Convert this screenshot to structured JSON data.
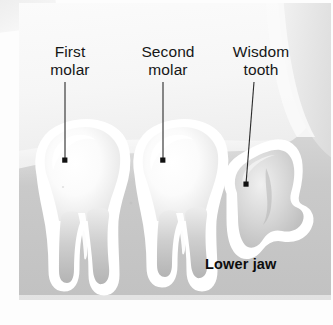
{
  "figure": {
    "type": "anatomical-illustration",
    "background_color": "#eeeeee",
    "label_color": "#161616",
    "leader_line_color": "#2a2a2a",
    "bone_color": "#c9c9c9",
    "tooth_color": "#f4f4f4",
    "halo_color": "#ffffff"
  },
  "labels": {
    "first_molar": "First\nmolar",
    "second_molar": "Second\nmolar",
    "wisdom_tooth": "Wisdom\ntooth",
    "lower_jaw": "Lower jaw"
  },
  "leaders": [
    {
      "name": "first-molar-leader",
      "x1": 65,
      "y1": 82,
      "x2": 65,
      "y2": 160
    },
    {
      "name": "second-molar-leader",
      "x1": 163,
      "y1": 82,
      "x2": 163,
      "y2": 160
    },
    {
      "name": "wisdom-tooth-leader",
      "x1": 254,
      "y1": 82,
      "x2": 246,
      "y2": 184
    }
  ],
  "structures": [
    {
      "name": "first-molar",
      "description": "Fully erupted first molar with crown and two roots"
    },
    {
      "name": "second-molar",
      "description": "Fully erupted second molar with crown and two roots"
    },
    {
      "name": "wisdom-tooth",
      "description": "Impacted third molar tilted forward inside the bone"
    },
    {
      "name": "mandible",
      "description": "Lower jaw bone surrounding the tooth roots"
    }
  ]
}
